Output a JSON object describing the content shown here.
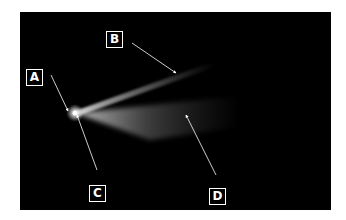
{
  "figure": {
    "labels": [
      {
        "id": "A",
        "text": "A",
        "box": [
          26,
          69
        ],
        "arrow_from": [
          51,
          75
        ],
        "arrow_to": [
          68,
          111
        ]
      },
      {
        "id": "B",
        "text": "B",
        "box": [
          106,
          31
        ],
        "arrow_from": [
          132,
          43
        ],
        "arrow_to": [
          176,
          73
        ]
      },
      {
        "id": "C",
        "text": "C",
        "box": [
          89,
          185
        ],
        "arrow_from": [
          97,
          170
        ],
        "arrow_to": [
          77,
          115
        ]
      },
      {
        "id": "D",
        "text": "D",
        "box": [
          209,
          188
        ],
        "arrow_from": [
          216,
          175
        ],
        "arrow_to": [
          186,
          115
        ]
      }
    ],
    "colors": {
      "background": "#000000",
      "page": "#ffffff",
      "label": "#ffffff",
      "glow": "#e8e8e8"
    }
  }
}
